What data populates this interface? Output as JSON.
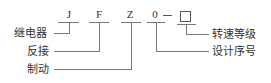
{
  "codes": {
    "c1": "J",
    "c2": "F",
    "c3": "Z",
    "c4": "0"
  },
  "labels_left": {
    "relay": "继电器",
    "reverse": "反接",
    "brake": "制动"
  },
  "labels_right": {
    "speed_grade": "转速等级",
    "design_no": "设计序号"
  },
  "placeholder_box": "□"
}
